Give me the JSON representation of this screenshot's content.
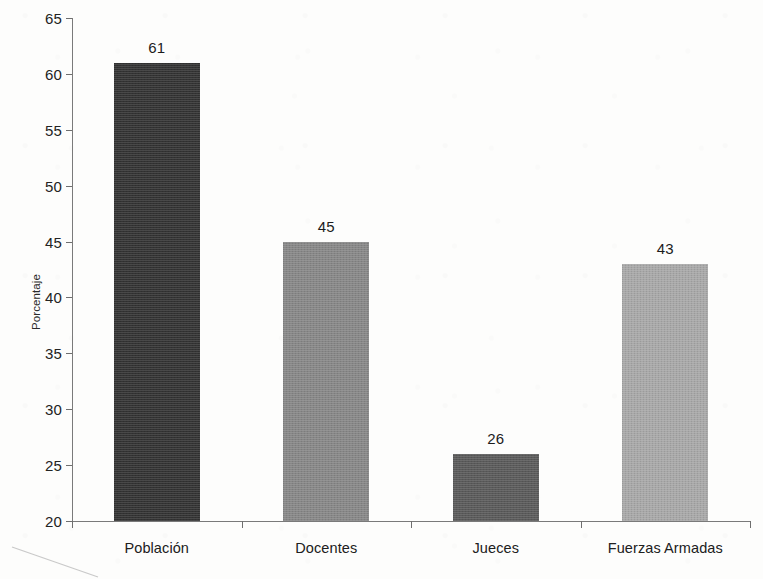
{
  "chart_data": {
    "type": "bar",
    "title": "",
    "subtitle": "",
    "xlabel": "",
    "ylabel": "Porcentaje",
    "categories": [
      "Población",
      "Docentes",
      "Jueces",
      "Fuerzas Armadas"
    ],
    "values": [
      61,
      45,
      26,
      43
    ],
    "value_labels": [
      "61",
      "45",
      "26",
      "43"
    ],
    "ylim": [
      20,
      65
    ],
    "ytick_step": 5,
    "ytick_labels": [
      "20",
      "25",
      "30",
      "35",
      "40",
      "45",
      "50",
      "55",
      "60",
      "65"
    ],
    "ytick_values": [
      20,
      25,
      30,
      35,
      40,
      45,
      50,
      55,
      60,
      65
    ],
    "grid": false,
    "legend": false,
    "legend_position": "none",
    "bar_colors": [
      "#333333",
      "#878787",
      "#5a5a5a",
      "#a8a8a8"
    ],
    "axis_color": "#7a7a7a",
    "background_color": "#fdfdfc"
  }
}
